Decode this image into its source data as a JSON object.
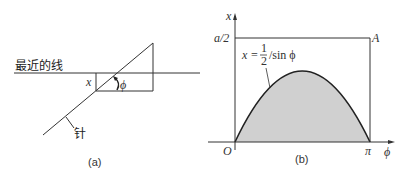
{
  "panel_a": {
    "caption": "(a)",
    "nearest_line_label": "最近的线",
    "needle_label": "针",
    "distance_label": "x",
    "angle_label": "ϕ"
  },
  "panel_b": {
    "caption": "(b)",
    "y_axis_label": "x",
    "x_axis_label": "ϕ",
    "origin_label": "O",
    "y_tick_label": "a/2",
    "x_tick_label": "π",
    "corner_label": "A",
    "curve_label_prefix": "x =",
    "curve_label_num": "1",
    "curve_label_den": "2",
    "curve_label_suffix": "/sin ϕ"
  },
  "colors": {
    "line": "#333333",
    "fill": "#d0d0d0"
  }
}
